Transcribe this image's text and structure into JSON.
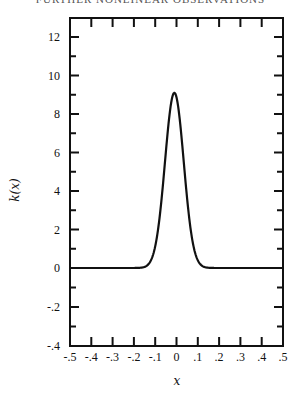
{
  "header": {
    "running_title": "FURTHER NONLINEAR OBSERVATIONS"
  },
  "chart_data": {
    "type": "line",
    "title": "",
    "xlabel": "x",
    "ylabel": "k(x)",
    "xlim": [
      -0.5,
      0.5
    ],
    "x_ticks": [
      "-.5",
      "-.4",
      "-.3",
      "-.2",
      "-.1",
      "0",
      ".1",
      ".2",
      ".3",
      ".4",
      ".5"
    ],
    "y_ticks": [
      "12",
      "10",
      "8",
      "6",
      "4",
      "2",
      "0",
      "-.2",
      "-.4"
    ],
    "y_axis_note": "Broken scale: 0 to 12 in units of 1 above baseline; -0.4 to 0 below baseline",
    "grid": false,
    "legend": null,
    "series": [
      {
        "name": "k(x)",
        "x": [
          -0.5,
          -0.3,
          -0.2,
          -0.15,
          -0.12,
          -0.1,
          -0.08,
          -0.06,
          -0.04,
          -0.02,
          -0.01,
          0.0,
          0.02,
          0.04,
          0.06,
          0.08,
          0.1,
          0.12,
          0.15,
          0.2,
          0.3,
          0.5
        ],
        "y": [
          0.0,
          0.0,
          0.0,
          0.05,
          0.25,
          0.7,
          1.7,
          3.4,
          5.8,
          8.2,
          9.1,
          8.9,
          7.4,
          4.9,
          2.7,
          1.2,
          0.45,
          0.12,
          0.02,
          0.0,
          0.0,
          0.0
        ]
      }
    ],
    "peak": {
      "x": -0.01,
      "y": 9.1
    }
  }
}
